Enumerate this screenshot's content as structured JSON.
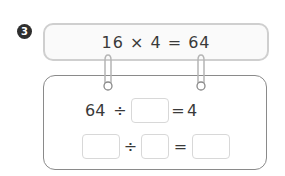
{
  "problem": {
    "number": "3",
    "given_equation": "16 × 4 = 64",
    "rows": [
      {
        "parts": [
          "64",
          "÷",
          "",
          "=",
          "4"
        ]
      },
      {
        "parts": [
          "",
          "÷",
          "",
          "=",
          ""
        ]
      }
    ]
  },
  "colors": {
    "badge_bg": "#2e2e2e",
    "top_border": "#cfcfcf",
    "bottom_border": "#8a8a8a",
    "blank_border": "#d8d8d8"
  }
}
